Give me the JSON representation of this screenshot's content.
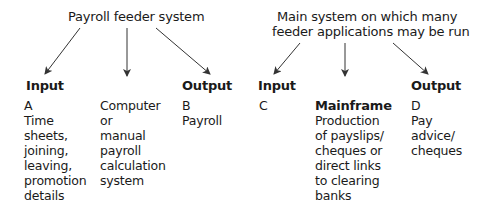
{
  "left_diagram": {
    "title": "Payroll feeder system",
    "input_heading": "Input",
    "output_heading": "Output",
    "input_column": {
      "label": "A",
      "lines": [
        "Time",
        "sheets,",
        "joining,",
        "leaving,",
        "promotion",
        "details"
      ]
    },
    "process_column": {
      "lines": [
        "Computer",
        "or",
        "manual",
        "payroll",
        "calculation",
        "system"
      ]
    },
    "output_column": {
      "label": "B",
      "lines": [
        "Payroll"
      ]
    }
  },
  "right_diagram": {
    "title_line1": "Main system on which many",
    "title_line2": "feeder applications may be run",
    "input_heading": "Input",
    "output_heading": "Output",
    "input_column": {
      "label": "C",
      "lines": []
    },
    "process_column": {
      "heading": "Mainframe",
      "lines": [
        "Production",
        "of payslips/",
        "cheques or",
        "direct links",
        "to clearing",
        "banks"
      ]
    },
    "output_column": {
      "label": "D",
      "lines": [
        "Pay",
        "advice/",
        "cheques"
      ]
    }
  },
  "colors": {
    "text": "#1a1a1a",
    "arrow": "#333333",
    "background": "#ffffff"
  }
}
